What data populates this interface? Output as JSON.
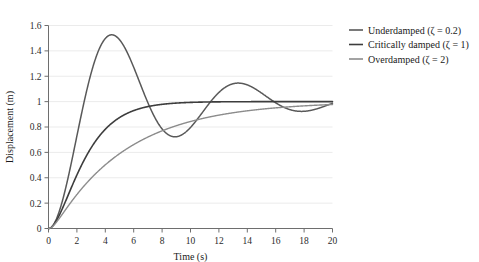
{
  "chart_data": {
    "type": "line",
    "title": "",
    "xlabel": "Time (s)",
    "ylabel": "Displacement (m)",
    "xlim": [
      0,
      20
    ],
    "ylim": [
      0,
      1.6
    ],
    "xticks": [
      0,
      2,
      4,
      6,
      8,
      10,
      12,
      14,
      16,
      18,
      20
    ],
    "yticks": [
      0,
      0.2,
      0.4,
      0.6,
      0.8,
      1,
      1.2,
      1.4,
      1.6
    ],
    "xtick_labels": [
      "0",
      "2",
      "4",
      "6",
      "8",
      "10",
      "12",
      "14",
      "16",
      "18",
      "20"
    ],
    "ytick_labels": [
      "0",
      "0.2",
      "0.4",
      "0.6",
      "0.8",
      "1",
      "1.2",
      "1.4",
      "1.6"
    ],
    "grid": "horizontal",
    "grid_color": "#ebebeb",
    "legend_position": "right",
    "steady_state": 1.0,
    "natural_frequency": 0.72,
    "series": [
      {
        "name": "Underdamped (ζ = 0.2)",
        "label": "Underdamped (ζ = 0.2)",
        "zeta": 0.2,
        "color": "#595959",
        "width": 1.5,
        "model": "step-response",
        "extrema": [
          {
            "t": 3.2,
            "y": 1.55,
            "kind": "peak"
          },
          {
            "t": 6.4,
            "y": 0.71,
            "kind": "trough"
          },
          {
            "t": 9.6,
            "y": 1.17,
            "kind": "peak"
          },
          {
            "t": 12.8,
            "y": 0.92,
            "kind": "trough"
          },
          {
            "t": 15.8,
            "y": 1.05,
            "kind": "peak"
          },
          {
            "t": 19.0,
            "y": 0.98,
            "kind": "trough"
          }
        ]
      },
      {
        "name": "Critically damped (ζ = 1)",
        "label": "Critically damped (ζ = 1)",
        "zeta": 1,
        "color": "#3d3d3d",
        "width": 1.6,
        "model": "step-response",
        "extrema": []
      },
      {
        "name": "Overdamped (ζ = 2)",
        "label": "Overdamped (ζ = 2)",
        "zeta": 2,
        "color": "#8c8c8c",
        "width": 1.4,
        "model": "step-response",
        "extrema": []
      }
    ]
  },
  "legend": {
    "items": [
      {
        "label": "Underdamped (ζ = 0.2)",
        "color": "#595959"
      },
      {
        "label": "Critically damped (ζ = 1)",
        "color": "#3d3d3d"
      },
      {
        "label": "Overdamped (ζ = 2)",
        "color": "#8c8c8c"
      }
    ]
  },
  "axes": {
    "x_title": "Time (s)",
    "y_title": "Displacement (m)",
    "axis_color": "#6e6e6e"
  }
}
